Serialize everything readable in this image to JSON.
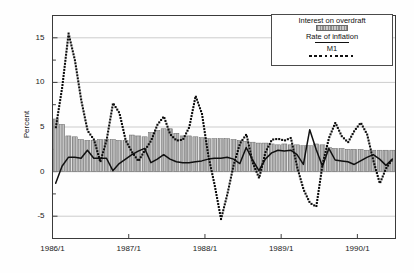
{
  "chart_data": {
    "type": "bar",
    "title": "",
    "subtitle": "",
    "xlabel": "",
    "ylabel": "Percent",
    "ylim": [
      -7.5,
      17.5
    ],
    "xlim": [
      0,
      54
    ],
    "yticks": [
      15,
      10,
      5,
      0,
      -5
    ],
    "ytick_labels": [
      "15",
      "10",
      "5",
      "0",
      "-5"
    ],
    "yminor_ticks": [
      17.5,
      12.5,
      7.5,
      2.5,
      -2.5,
      -7.5
    ],
    "xtick_positions": [
      0,
      12,
      24,
      36,
      48
    ],
    "xtick_labels": [
      "1986/1",
      "1987/1",
      "1988/1",
      "1989/1",
      "1990/1"
    ],
    "grid": "horizontal-major",
    "legend_position": "top-right",
    "frame": true,
    "categories": [
      "1986/1",
      "1986/2",
      "1986/3",
      "1986/4",
      "1986/5",
      "1986/6",
      "1986/7",
      "1986/8",
      "1986/9",
      "1986/10",
      "1986/11",
      "1986/12",
      "1987/1",
      "1987/2",
      "1987/3",
      "1987/4",
      "1987/5",
      "1987/6",
      "1987/7",
      "1987/8",
      "1987/9",
      "1987/10",
      "1987/11",
      "1987/12",
      "1988/1",
      "1988/2",
      "1988/3",
      "1988/4",
      "1988/5",
      "1988/6",
      "1988/7",
      "1988/8",
      "1988/9",
      "1988/10",
      "1988/11",
      "1988/12",
      "1989/1",
      "1989/2",
      "1989/3",
      "1989/4",
      "1989/5",
      "1989/6",
      "1989/7",
      "1989/8",
      "1989/9",
      "1989/10",
      "1989/11",
      "1989/12",
      "1990/1",
      "1990/2",
      "1990/3",
      "1990/4",
      "1990/5",
      "1990/6"
    ],
    "series": [
      {
        "name": "Interest on overdraft",
        "type": "bar",
        "color": "#9a9a9a",
        "values": [
          5.9,
          5.3,
          4.0,
          3.9,
          3.6,
          3.5,
          3.5,
          3.6,
          3.6,
          3.6,
          3.5,
          3.5,
          4.1,
          4.0,
          3.9,
          4.4,
          4.6,
          4.8,
          4.8,
          4.3,
          4.0,
          4.0,
          3.9,
          3.8,
          3.7,
          3.7,
          3.7,
          3.7,
          3.6,
          3.5,
          3.4,
          3.3,
          3.2,
          3.2,
          3.1,
          3.0,
          3.1,
          3.0,
          3.0,
          2.9,
          2.9,
          3.1,
          3.0,
          2.7,
          2.6,
          2.6,
          2.5,
          2.5,
          2.5,
          2.4,
          2.4,
          2.4,
          2.4,
          2.4
        ]
      },
      {
        "name": "Rate of inflation",
        "type": "line",
        "color": "#101010",
        "values": [
          -1.3,
          0.6,
          1.6,
          1.6,
          1.5,
          2.4,
          1.5,
          1.5,
          1.5,
          0.1,
          0.9,
          1.4,
          1.9,
          2.3,
          2.6,
          1.0,
          1.4,
          1.9,
          1.4,
          1.1,
          1.0,
          1.0,
          1.1,
          1.2,
          1.4,
          1.5,
          1.5,
          1.6,
          1.4,
          0.9,
          2.7,
          1.3,
          0.1,
          1.4,
          2.1,
          2.4,
          2.3,
          2.4,
          1.9,
          0.8,
          4.7,
          2.5,
          0.6,
          2.6,
          1.3,
          1.2,
          1.1,
          0.8,
          1.2,
          1.6,
          1.9,
          1.4,
          0.7,
          1.4
        ]
      },
      {
        "name": "M1",
        "type": "dotted-line",
        "color": "#0d0d0d",
        "values": [
          5.0,
          9.5,
          15.5,
          12.5,
          8.0,
          4.6,
          3.6,
          1.1,
          3.6,
          7.7,
          6.6,
          3.5,
          2.2,
          1.2,
          2.4,
          3.5,
          5.3,
          6.2,
          4.2,
          3.5,
          3.6,
          5.0,
          8.5,
          6.5,
          1.8,
          -1.5,
          -5.3,
          -2.5,
          0.8,
          3.2,
          4.2,
          1.0,
          -0.7,
          2.2,
          3.6,
          3.7,
          3.5,
          3.8,
          0.5,
          -2.0,
          -3.5,
          -3.9,
          0.9,
          3.8,
          5.5,
          4.0,
          3.3,
          4.6,
          5.5,
          4.2,
          1.2,
          -1.3,
          0.4,
          1.4
        ]
      }
    ]
  },
  "legend": {
    "entries": [
      {
        "label": "Interest on overdraft",
        "marker": "bar-swatch"
      },
      {
        "label": "Rate of inflation",
        "marker": "solid-line"
      },
      {
        "label": "M1",
        "marker": "dotted-line"
      }
    ]
  }
}
